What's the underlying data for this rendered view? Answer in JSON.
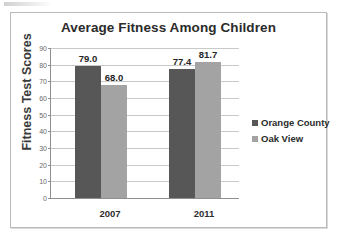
{
  "chart_data": {
    "type": "bar",
    "title": "Average Fitness Among Children",
    "xlabel": "",
    "ylabel": "Fitness Test Scores",
    "categories": [
      "2007",
      "2011"
    ],
    "series": [
      {
        "name": "Orange County",
        "color": "#575757",
        "values": [
          79.0,
          77.4
        ],
        "labels": [
          "79.0",
          "77.4"
        ]
      },
      {
        "name": "Oak View",
        "color": "#a3a3a3",
        "values": [
          68.0,
          81.7
        ],
        "labels": [
          "68.0",
          "81.7"
        ]
      }
    ],
    "ylim": [
      0,
      90
    ],
    "yticks": [
      0,
      10,
      20,
      30,
      40,
      50,
      60,
      70,
      80,
      90
    ],
    "ytick_labels": [
      "0",
      "10",
      "20",
      "30",
      "40",
      "50",
      "60",
      "70",
      "80",
      "90"
    ],
    "grid": true,
    "legend_position": "right",
    "data_labels_shown": true
  }
}
